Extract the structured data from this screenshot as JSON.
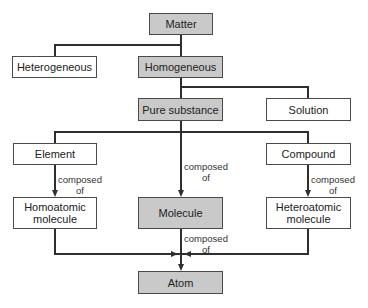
{
  "nodes": {
    "matter": "Matter",
    "heterogeneous": "Heterogeneous",
    "homogeneous": "Homogeneous",
    "pure_substance": "Pure substance",
    "solution": "Solution",
    "element": "Element",
    "compound": "Compound",
    "homoatomic_line1": "Homoatomic",
    "homoatomic_line2": "molecule",
    "molecule": "Molecule",
    "heteroatomic_line1": "Heteroatomic",
    "heteroatomic_line2": "molecule",
    "atom": "Atom"
  },
  "edge_labels": {
    "composed": "composed",
    "of": "of"
  },
  "colors": {
    "highlight_fill": "#c9c9c9",
    "plain_fill": "#ffffff",
    "line": "#2e2e2e"
  }
}
